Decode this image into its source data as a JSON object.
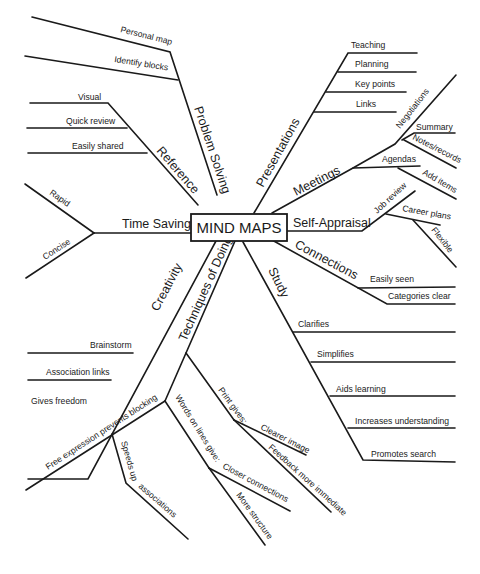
{
  "title": "MIND MAPS",
  "colors": {
    "ink": "#1a1a1a",
    "background": "#ffffff"
  },
  "branches": {
    "problem_solving": {
      "label": "Problem Solving",
      "children": [
        "Personal map",
        "Identify blocks"
      ]
    },
    "reference": {
      "label": "Reference",
      "children": [
        "Visual",
        "Quick review",
        "Easily shared"
      ]
    },
    "time_saving": {
      "label": "Time Saving",
      "children": [
        "Rapid",
        "Concise"
      ]
    },
    "creativity": {
      "label": "Creativity",
      "children": [
        "Brainstorm",
        "Association links",
        "Gives freedom"
      ]
    },
    "techniques": {
      "label": "Techniques of Doing",
      "children": {
        "free_expression": {
          "label": "Free expression prevents blocking",
          "children": [
            "Speeds up",
            "associations"
          ]
        },
        "words_on_lines": {
          "label": "Words on lines give:",
          "children": [
            "Closer connections",
            "More structure"
          ]
        },
        "print": {
          "label": "Print gives:",
          "children": [
            "Clearer image",
            "Feedback more immediate"
          ]
        }
      }
    },
    "study": {
      "label": "Study",
      "children": [
        "Clarifies",
        "Simplifies",
        "Aids learning",
        "Increases understanding",
        "Promotes search"
      ]
    },
    "connections": {
      "label": "Connections",
      "children": [
        "Easily seen",
        "Categories clear"
      ]
    },
    "self_appraisal": {
      "label": "Self-Appraisal",
      "children": {
        "job_review": {
          "label": "Job review",
          "children": [
            "Career plans",
            "Flexible"
          ]
        }
      }
    },
    "meetings": {
      "label": "Meetings",
      "children": {
        "negotiations": {
          "label": "Negotiations",
          "children": [
            "Summary",
            "Notes/records"
          ]
        },
        "agendas": {
          "label": "Agendas",
          "children": [
            "Add items"
          ]
        }
      }
    },
    "presentations": {
      "label": "Presentations",
      "children": [
        "Teaching",
        "Planning",
        "Key points",
        "Links"
      ]
    }
  }
}
